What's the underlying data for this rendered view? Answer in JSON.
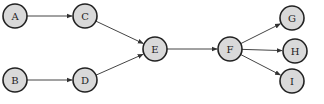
{
  "diagram": {
    "type": "directed-graph",
    "node_fill": "#d9d9d9",
    "node_stroke": "#222222",
    "edge_color": "#444444",
    "nodes": [
      {
        "id": "A",
        "label": "A",
        "x": 15,
        "y": 16
      },
      {
        "id": "B",
        "label": "B",
        "x": 15,
        "y": 80
      },
      {
        "id": "C",
        "label": "C",
        "x": 85,
        "y": 16
      },
      {
        "id": "D",
        "label": "D",
        "x": 85,
        "y": 80
      },
      {
        "id": "E",
        "label": "E",
        "x": 155,
        "y": 49
      },
      {
        "id": "F",
        "label": "F",
        "x": 230,
        "y": 49
      },
      {
        "id": "G",
        "label": "G",
        "x": 292,
        "y": 18
      },
      {
        "id": "H",
        "label": "H",
        "x": 295,
        "y": 51
      },
      {
        "id": "I",
        "label": "I",
        "x": 292,
        "y": 81
      }
    ],
    "edges": [
      {
        "from": "A",
        "to": "C"
      },
      {
        "from": "B",
        "to": "D"
      },
      {
        "from": "C",
        "to": "E"
      },
      {
        "from": "D",
        "to": "E"
      },
      {
        "from": "E",
        "to": "F"
      },
      {
        "from": "F",
        "to": "G"
      },
      {
        "from": "F",
        "to": "H"
      },
      {
        "from": "F",
        "to": "I"
      }
    ]
  }
}
